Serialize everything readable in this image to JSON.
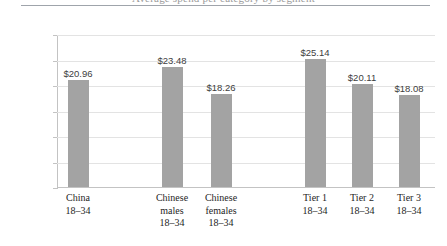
{
  "chart_data": {
    "type": "bar",
    "title": "",
    "xlabel": "",
    "ylabel": "",
    "ylim": [
      0,
      30
    ],
    "ytick_step": 5,
    "grid": true,
    "legend": "none",
    "currency_prefix": "$",
    "categories": [
      "China\n18–34",
      "",
      "Chinese\nmales\n18–34",
      "Chinese\nfemales\n18–34",
      "",
      "Tier 1\n18–34",
      "Tier 2\n18–34",
      "Tier 3\n18–34"
    ],
    "values": [
      20.96,
      null,
      23.48,
      18.26,
      null,
      25.14,
      20.11,
      18.08
    ],
    "data_labels": [
      "$20.96",
      "",
      "$23.48",
      "$18.26",
      "",
      "$25.14",
      "$20.11",
      "$18.08"
    ],
    "ytick_labels": [
      "$30.00",
      "$25.00",
      "$20.00",
      "$15.00",
      "$10.00",
      "$5.00",
      "$0.00"
    ],
    "ytick_values": [
      30,
      25,
      20,
      15,
      10,
      5,
      0
    ],
    "bar_color": "#a3a3a3",
    "gridline_color": "#e3e3e3",
    "axis_color": "#c3c3c3"
  },
  "bars": [
    {
      "name": "china-18-34",
      "label": "$20.96",
      "value": 20.96,
      "x": 68,
      "category": "China\n18–34"
    },
    {
      "name": "chinese-males-18-34",
      "label": "$23.48",
      "value": 23.48,
      "x": 162,
      "category": "Chinese\nmales\n18–34"
    },
    {
      "name": "chinese-females-18-34",
      "label": "$18.26",
      "value": 18.26,
      "x": 211,
      "category": "Chinese\nfemales\n18–34"
    },
    {
      "name": "tier-1-18-34",
      "label": "$25.14",
      "value": 25.14,
      "x": 305,
      "category": "Tier 1\n18–34"
    },
    {
      "name": "tier-2-18-34",
      "label": "$20.11",
      "value": 20.11,
      "x": 352,
      "category": "Tier 2\n18–34"
    },
    {
      "name": "tier-3-18-34",
      "label": "$18.08",
      "value": 18.08,
      "x": 399,
      "category": "Tier 3\n18–34"
    }
  ],
  "yticks": [
    {
      "label": "$30.00",
      "value": 30
    },
    {
      "label": "$25.00",
      "value": 25
    },
    {
      "label": "$20.00",
      "value": 20
    },
    {
      "label": "$15.00",
      "value": 15
    },
    {
      "label": "$10.00",
      "value": 10
    },
    {
      "label": "$5.00",
      "value": 5
    },
    {
      "label": "$0.00",
      "value": 0
    }
  ],
  "title": {
    "clipped_text": "Average spend per category by segment"
  }
}
